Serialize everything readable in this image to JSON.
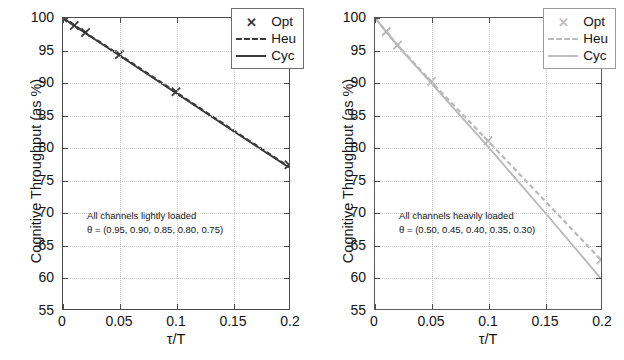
{
  "figure": {
    "panel_count": 2,
    "background": "#ffffff"
  },
  "chart_data": [
    {
      "type": "line",
      "panel": "left",
      "title": "",
      "xlabel": "τ/T",
      "ylabel": "Cognitive Throughput (as %)",
      "xlim": [
        0,
        0.2
      ],
      "ylim": [
        55,
        100
      ],
      "xticks": [
        0,
        0.05,
        0.1,
        0.15,
        0.2
      ],
      "xticklabels": [
        "0",
        "0.05",
        "0.1",
        "0.15",
        "0.2"
      ],
      "yticks": [
        55,
        60,
        65,
        70,
        75,
        80,
        85,
        90,
        95,
        100
      ],
      "yticklabels": [
        "55",
        "60",
        "65",
        "70",
        "75",
        "80",
        "85",
        "90",
        "95",
        "100"
      ],
      "grid": true,
      "legend_position": "upper right",
      "color": "#3a3a3a",
      "annotation": {
        "line1": "All channels lightly loaded",
        "line2": "θ = (0.95, 0.90, 0.85, 0.80, 0.75)",
        "x": 0.022,
        "y": 70.5
      },
      "series": [
        {
          "name": "Opt",
          "style": "marker",
          "marker": "x",
          "x": [
            0,
            0.01,
            0.02,
            0.05,
            0.1,
            0.2
          ],
          "values": [
            100.0,
            98.85,
            97.75,
            94.35,
            88.6,
            77.3
          ]
        },
        {
          "name": "Heu",
          "style": "dashed",
          "x": [
            0,
            0.01,
            0.02,
            0.05,
            0.1,
            0.15,
            0.2
          ],
          "values": [
            100.0,
            98.85,
            97.7,
            94.3,
            88.5,
            82.7,
            77.0
          ]
        },
        {
          "name": "Cyc",
          "style": "solid",
          "x": [
            0,
            0.01,
            0.02,
            0.05,
            0.1,
            0.15,
            0.2
          ],
          "values": [
            100.0,
            98.8,
            97.65,
            94.2,
            88.4,
            82.6,
            76.9
          ]
        }
      ]
    },
    {
      "type": "line",
      "panel": "right",
      "title": "",
      "xlabel": "τ/T",
      "ylabel": "Cognitive Throughput (as %)",
      "xlim": [
        0,
        0.2
      ],
      "ylim": [
        55,
        100
      ],
      "xticks": [
        0,
        0.05,
        0.1,
        0.15,
        0.2
      ],
      "xticklabels": [
        "0",
        "0.05",
        "0.1",
        "0.15",
        "0.2"
      ],
      "yticks": [
        55,
        60,
        65,
        70,
        75,
        80,
        85,
        90,
        95,
        100
      ],
      "yticklabels": [
        "55",
        "60",
        "65",
        "70",
        "75",
        "80",
        "85",
        "90",
        "95",
        "100"
      ],
      "grid": true,
      "legend_position": "upper right",
      "color": "#b9b9b9",
      "annotation": {
        "line1": "All channels heavily loaded",
        "line2": "θ = (0.50, 0.45, 0.40, 0.35, 0.30)",
        "x": 0.022,
        "y": 70.5
      },
      "series": [
        {
          "name": "Opt",
          "style": "marker",
          "marker": "x",
          "x": [
            0,
            0.01,
            0.02,
            0.05,
            0.1,
            0.2
          ],
          "values": [
            100.0,
            97.9,
            95.8,
            90.2,
            81.0,
            62.6
          ]
        },
        {
          "name": "Heu",
          "style": "dashed",
          "x": [
            0,
            0.01,
            0.02,
            0.05,
            0.1,
            0.15,
            0.2
          ],
          "values": [
            100.0,
            97.9,
            95.8,
            90.1,
            81.0,
            71.8,
            62.6
          ]
        },
        {
          "name": "Cyc",
          "style": "solid",
          "x": [
            0,
            0.01,
            0.02,
            0.05,
            0.1,
            0.15,
            0.2
          ],
          "values": [
            100.0,
            97.85,
            95.7,
            89.9,
            80.1,
            70.0,
            59.7
          ]
        }
      ]
    }
  ],
  "panels": [
    {
      "id": "left",
      "axis_y_title": "Cognitive Throughput (as %)",
      "axis_x_title": "τ/T",
      "legend": [
        {
          "label": "Opt",
          "sample": "x-marker"
        },
        {
          "label": "Heu",
          "sample": "dashed-line"
        },
        {
          "label": "Cyc",
          "sample": "solid-line"
        }
      ],
      "annotation_line1": "All channels lightly loaded",
      "annotation_line2": "θ = (0.95, 0.90, 0.85, 0.80, 0.75)",
      "ytick_labels": [
        "100",
        "95",
        "90",
        "85",
        "80",
        "75",
        "70",
        "65",
        "60",
        "55"
      ],
      "xtick_labels": [
        "0",
        "0.05",
        "0.1",
        "0.15",
        "0.2"
      ],
      "series_color": "#3a3a3a"
    },
    {
      "id": "right",
      "axis_y_title": "Cognitive Throughput (as %)",
      "axis_x_title": "τ/T",
      "legend": [
        {
          "label": "Opt",
          "sample": "x-marker"
        },
        {
          "label": "Heu",
          "sample": "dashed-line"
        },
        {
          "label": "Cyc",
          "sample": "solid-line"
        }
      ],
      "annotation_line1": "All channels heavily loaded",
      "annotation_line2": "θ = (0.50, 0.45, 0.40, 0.35, 0.30)",
      "ytick_labels": [
        "100",
        "95",
        "90",
        "85",
        "80",
        "75",
        "70",
        "65",
        "60",
        "55"
      ],
      "xtick_labels": [
        "0",
        "0.05",
        "0.1",
        "0.15",
        "0.2"
      ],
      "series_color": "#b9b9b9"
    }
  ]
}
